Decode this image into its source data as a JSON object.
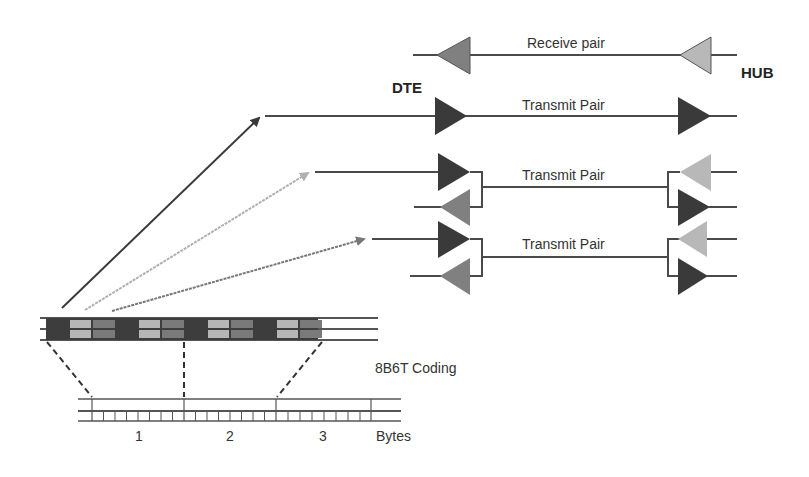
{
  "labels": {
    "receive_pair": "Receive pair",
    "transmit_pair_1": "Transmit Pair",
    "transmit_pair_2": "Transmit Pair",
    "transmit_pair_3": "Transmit Pair",
    "dte": "DTE",
    "hub": "HUB",
    "coding": "8B6T Coding",
    "byte_1": "1",
    "byte_2": "2",
    "byte_3": "3",
    "bytes": "Bytes"
  },
  "colors": {
    "dark": "#3a3a3a",
    "mid": "#7a7a7a",
    "light": "#b4b4b4",
    "line": "#4a4a4a"
  }
}
